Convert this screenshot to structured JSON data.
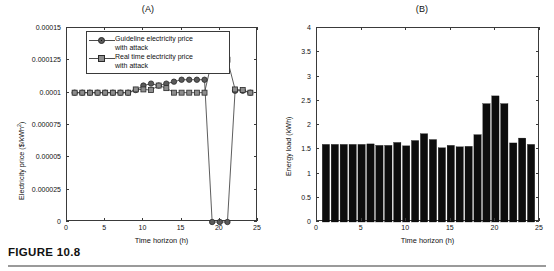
{
  "figure": {
    "caption": "FIGURE 10.8"
  },
  "panel_a": {
    "title": "(A)",
    "xlabel": "Time horizon (h)",
    "ylabel": "Electricity price ($/kWh",
    "ylabel_sup": "2",
    "ylabel_tail": ")",
    "yticks": [
      "0",
      "0.000025",
      "0.00005",
      "0.000075",
      "0.0001",
      "0.000125",
      "0.00015"
    ],
    "xticks": [
      "0",
      "5",
      "10",
      "15",
      "20",
      "25"
    ],
    "legend": [
      {
        "label": "Guideline electricity price\nwith attack",
        "marker": "circle",
        "color": "#5a5a5a"
      },
      {
        "label": "Real time electricity price\nwith attack",
        "marker": "square",
        "color": "#8d8d8d"
      }
    ]
  },
  "panel_b": {
    "title": "(B)",
    "xlabel": "Time horizon (h)",
    "ylabel": "Energy load (kWh)",
    "yticks": [
      "0",
      "0.5",
      "1",
      "1.5",
      "2",
      "2.5",
      "3",
      "3.5",
      "4"
    ],
    "xticks": [
      "0",
      "5",
      "10",
      "15",
      "20",
      "25"
    ]
  },
  "chart_data": [
    {
      "type": "line",
      "panel": "(A)",
      "title": "(A)",
      "xlabel": "Time horizon (h)",
      "ylabel": "Electricity price ($/kWh^2)",
      "xlim": [
        0,
        25
      ],
      "ylim": [
        0,
        0.00015
      ],
      "yticks": [
        0,
        2.5e-05,
        5e-05,
        7.5e-05,
        0.0001,
        0.000125,
        0.00015
      ],
      "xticks": [
        0,
        5,
        10,
        15,
        20,
        25
      ],
      "grid": false,
      "legend_position": "upper-left-inside",
      "x": [
        1,
        2,
        3,
        4,
        5,
        6,
        7,
        8,
        9,
        10,
        11,
        12,
        13,
        14,
        15,
        16,
        17,
        18,
        19,
        20,
        21,
        22,
        23,
        24
      ],
      "series": [
        {
          "name": "Guideline electricity price with attack",
          "marker": "circle",
          "color": "#5a5a5a",
          "values": [
            0.0001,
            0.0001,
            0.0001,
            0.0001,
            0.0001,
            0.0001,
            0.0001,
            0.0001,
            0.000102,
            0.0001055,
            0.000107,
            0.0001055,
            0.000107,
            0.0001085,
            0.00011,
            0.00011,
            0.00011,
            0.00011,
            0,
            0,
            0,
            0.0001015,
            0.0001015,
            0.0001
          ]
        },
        {
          "name": "Real time electricity price with attack",
          "marker": "square",
          "color": "#8d8d8d",
          "values": [
            0.0001,
            0.0001,
            0.0001,
            0.0001,
            0.0001,
            0.0001,
            0.0001,
            0.0001,
            0.0001025,
            0.0001025,
            0.000102,
            0.0001055,
            0.0001035,
            0.0001,
            0.0001,
            0.0001,
            0.0001,
            0.0001,
            0.0001255,
            0.000131,
            0.0001255,
            0.0001025,
            0.000102,
            0.0001
          ]
        }
      ]
    },
    {
      "type": "bar",
      "panel": "(B)",
      "title": "(B)",
      "xlabel": "Time horizon (h)",
      "ylabel": "Energy load (kWh)",
      "xlim": [
        0,
        25
      ],
      "ylim": [
        0,
        4
      ],
      "yticks": [
        0,
        0.5,
        1,
        1.5,
        2,
        2.5,
        3,
        3.5,
        4
      ],
      "xticks": [
        0,
        5,
        10,
        15,
        20,
        25
      ],
      "grid": false,
      "bar_color": "#0d0d0d",
      "categories": [
        1,
        2,
        3,
        4,
        5,
        6,
        7,
        8,
        9,
        10,
        11,
        12,
        13,
        14,
        15,
        16,
        17,
        18,
        19,
        20,
        21,
        22,
        23,
        24
      ],
      "values": [
        1.6,
        1.6,
        1.6,
        1.6,
        1.6,
        1.61,
        1.58,
        1.58,
        1.64,
        1.57,
        1.68,
        1.82,
        1.7,
        1.53,
        1.58,
        1.55,
        1.56,
        1.8,
        2.44,
        2.6,
        2.44,
        1.63,
        1.73,
        1.6
      ]
    }
  ]
}
